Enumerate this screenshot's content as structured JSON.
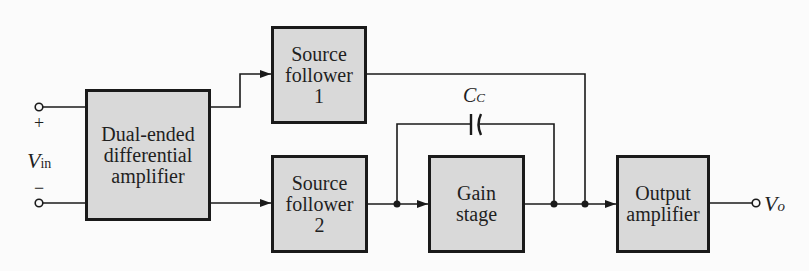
{
  "diagram": {
    "type": "block-diagram",
    "title": "",
    "colors": {
      "background": "#fbfbfb",
      "block_fill": "#d9d9d9",
      "line": "#1a1a1a"
    },
    "input": {
      "label": "V",
      "subscript": "in",
      "plus": "+",
      "minus": "−"
    },
    "output": {
      "label": "V",
      "subscript": "o"
    },
    "blocks": {
      "diff_amp": {
        "lines": [
          "Dual-ended",
          "differential",
          "amplifier"
        ]
      },
      "sf1": {
        "lines": [
          "Source",
          "follower",
          "1"
        ]
      },
      "sf2": {
        "lines": [
          "Source",
          "follower",
          "2"
        ]
      },
      "gain": {
        "lines": [
          "Gain",
          "stage"
        ]
      },
      "out_amp": {
        "lines": [
          "Output",
          "amplifier"
        ]
      }
    },
    "capacitor": {
      "label": "C",
      "subscript": "C"
    },
    "connections": [
      {
        "from": "input+",
        "to": "diff_amp"
      },
      {
        "from": "input-",
        "to": "diff_amp"
      },
      {
        "from": "diff_amp",
        "to": "sf1"
      },
      {
        "from": "diff_amp",
        "to": "sf2"
      },
      {
        "from": "sf2",
        "to": "gain"
      },
      {
        "from": "sf2/gain-input node",
        "to": "gain-output node",
        "via": "capacitor"
      },
      {
        "from": "gain",
        "to": "out_amp"
      },
      {
        "from": "sf1",
        "to": "out_amp input node"
      },
      {
        "from": "out_amp",
        "to": "output"
      }
    ]
  }
}
